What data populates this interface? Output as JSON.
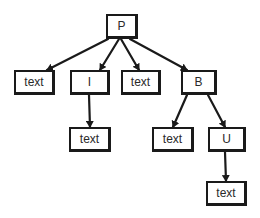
{
  "diagram": {
    "type": "tree",
    "style": "hand-drawn",
    "colors": {
      "stroke": "#1a1a1a",
      "text": "#2a2a2a",
      "background": "#ffffff"
    },
    "nodes": [
      {
        "id": "P",
        "label": "P",
        "x": 106,
        "y": 14,
        "w": 32,
        "h": 25
      },
      {
        "id": "text1",
        "label": "text",
        "x": 14,
        "y": 70,
        "w": 41,
        "h": 25
      },
      {
        "id": "I",
        "label": "I",
        "x": 70,
        "y": 70,
        "w": 40,
        "h": 25
      },
      {
        "id": "text2",
        "label": "text",
        "x": 121,
        "y": 70,
        "w": 40,
        "h": 25
      },
      {
        "id": "B",
        "label": "B",
        "x": 181,
        "y": 70,
        "w": 36,
        "h": 25
      },
      {
        "id": "text3",
        "label": "text",
        "x": 69,
        "y": 127,
        "w": 42,
        "h": 25
      },
      {
        "id": "text4",
        "label": "text",
        "x": 152,
        "y": 127,
        "w": 42,
        "h": 25
      },
      {
        "id": "U",
        "label": "U",
        "x": 208,
        "y": 127,
        "w": 38,
        "h": 25
      },
      {
        "id": "text5",
        "label": "text",
        "x": 206,
        "y": 181,
        "w": 41,
        "h": 25
      }
    ],
    "edges": [
      {
        "from": "P",
        "to": "text1",
        "x1": 108,
        "y1": 39,
        "x2": 47,
        "y2": 70
      },
      {
        "from": "P",
        "to": "I",
        "x1": 119,
        "y1": 39,
        "x2": 100,
        "y2": 70
      },
      {
        "from": "P",
        "to": "text2",
        "x1": 121,
        "y1": 39,
        "x2": 139,
        "y2": 70
      },
      {
        "from": "P",
        "to": "B",
        "x1": 130,
        "y1": 39,
        "x2": 187,
        "y2": 70
      },
      {
        "from": "I",
        "to": "text3",
        "x1": 89,
        "y1": 95,
        "x2": 90,
        "y2": 127
      },
      {
        "from": "B",
        "to": "text4",
        "x1": 187,
        "y1": 95,
        "x2": 173,
        "y2": 127
      },
      {
        "from": "B",
        "to": "U",
        "x1": 208,
        "y1": 95,
        "x2": 225,
        "y2": 127
      },
      {
        "from": "U",
        "to": "text5",
        "x1": 225,
        "y1": 152,
        "x2": 226,
        "y2": 181
      }
    ]
  }
}
